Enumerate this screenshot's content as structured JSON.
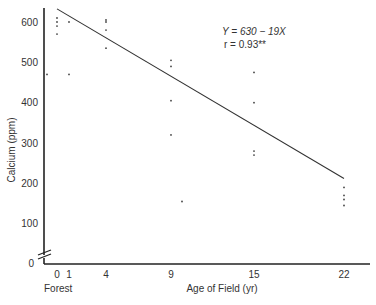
{
  "chart_data": {
    "type": "scatter",
    "title": "",
    "xlabel": "Age of Field (yr)",
    "ylabel": "Calcium (ppm)",
    "x_extra_label": "Forest",
    "x_ticks": [
      "0",
      "1",
      "4",
      "9",
      "15",
      "22"
    ],
    "y_ticks": [
      "0",
      "100",
      "200",
      "300",
      "400",
      "500",
      "600"
    ],
    "ylim": [
      0,
      620
    ],
    "y_axis_break": true,
    "grid": false,
    "legend": null,
    "annotation": {
      "equation": "Y = 630 − 19X",
      "r": "r = 0.93**"
    },
    "regression_line": {
      "intercept": 630,
      "slope": -19,
      "x_range": [
        0,
        22
      ]
    },
    "series": [
      {
        "name": "observations",
        "points": [
          {
            "x": 0,
            "y": 610
          },
          {
            "x": 0,
            "y": 600
          },
          {
            "x": 0,
            "y": 590
          },
          {
            "x": 0,
            "y": 570
          },
          {
            "x": -1,
            "y": 470
          },
          {
            "x": 1,
            "y": 600
          },
          {
            "x": 1,
            "y": 470
          },
          {
            "x": 4,
            "y": 605
          },
          {
            "x": 4,
            "y": 600
          },
          {
            "x": 4,
            "y": 580
          },
          {
            "x": 4,
            "y": 535
          },
          {
            "x": 9,
            "y": 505
          },
          {
            "x": 9,
            "y": 490
          },
          {
            "x": 9,
            "y": 405
          },
          {
            "x": 9,
            "y": 320
          },
          {
            "x": 10,
            "y": 155
          },
          {
            "x": 15,
            "y": 475
          },
          {
            "x": 15,
            "y": 400
          },
          {
            "x": 15,
            "y": 280
          },
          {
            "x": 15,
            "y": 270
          },
          {
            "x": 22,
            "y": 190
          },
          {
            "x": 22,
            "y": 170
          },
          {
            "x": 22,
            "y": 160
          },
          {
            "x": 22,
            "y": 145
          }
        ]
      }
    ]
  }
}
